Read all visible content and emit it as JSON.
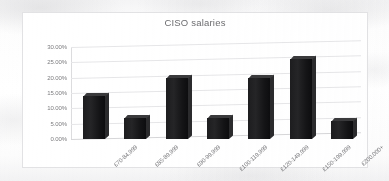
{
  "chart_data": {
    "type": "bar",
    "title": "CISO salaries",
    "xlabel": "",
    "ylabel": "",
    "categories": [
      "£70-84,999",
      "£85-89,999",
      "£90-99,999",
      "£100-119,999",
      "£120-149,999",
      "£150-199,999",
      "£200,000+"
    ],
    "values": [
      14,
      7,
      20,
      7,
      20,
      26,
      6
    ],
    "value_labels": [
      "14.00%",
      "7.00%",
      "20.00%",
      "7.00%",
      "20.00%",
      "26.00%",
      "6.00%"
    ],
    "ylim": [
      0,
      30
    ],
    "ytick_labels": [
      "30.00%",
      "25.00%",
      "20.00%",
      "15.00%",
      "10.00%",
      "5.00%",
      "0.00%"
    ],
    "ytick_values": [
      30,
      25,
      20,
      15,
      10,
      5,
      0
    ],
    "grid": true,
    "legend": false,
    "legend_position": "none",
    "style": "3d-column",
    "bar_color": "#1d1d1f",
    "grid_color": "#e6e6e8",
    "text_color": "#77777a",
    "plot_background": "#ffffff"
  }
}
